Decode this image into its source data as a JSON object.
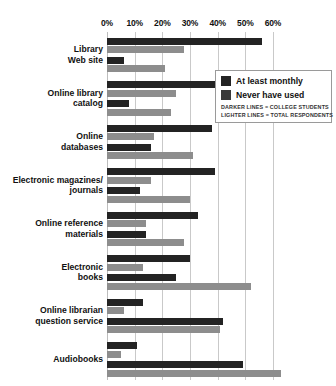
{
  "chart_data": {
    "type": "bar",
    "orientation": "horizontal",
    "title": "",
    "xlabel": "",
    "ylabel": "",
    "xlim": [
      0,
      60
    ],
    "grid": true,
    "tick_labels": [
      "0%",
      "10%",
      "20%",
      "30%",
      "40%",
      "50%",
      "60%"
    ],
    "tick_values": [
      0,
      10,
      20,
      30,
      40,
      50,
      60
    ],
    "legend_position": "upper-right",
    "categories": [
      "Library\nWeb site",
      "Online library\ncatalog",
      "Online\ndatabases",
      "Electronic magazines/\njournals",
      "Online reference\nmaterials",
      "Electronic\nbooks",
      "Online librarian\nquestion service",
      "Audiobooks"
    ],
    "series": [
      {
        "name": "At least monthly — college students",
        "group": "At least monthly",
        "audience": "College students",
        "shade": "darker",
        "values": [
          56,
          48,
          38,
          39,
          33,
          30,
          13,
          11
        ]
      },
      {
        "name": "At least monthly — total respondents",
        "group": "At least monthly",
        "audience": "Total respondents",
        "shade": "lighter",
        "values": [
          28,
          25,
          17,
          16,
          14,
          13,
          6,
          5
        ]
      },
      {
        "name": "Never have used — college students",
        "group": "Never have used",
        "audience": "College students",
        "shade": "darker",
        "values": [
          6,
          8,
          16,
          12,
          14,
          25,
          42,
          49
        ]
      },
      {
        "name": "Never have used — total respondents",
        "group": "Never have used",
        "audience": "Total respondents",
        "shade": "lighter",
        "values": [
          21,
          23,
          31,
          30,
          28,
          52,
          41,
          63
        ]
      }
    ],
    "notes": [
      "DARKER LINES = COLLEGE STUDENTS",
      "LIGHTER LINES = TOTAL RESPONDENTS"
    ]
  },
  "legend": {
    "items": [
      {
        "label": "At least monthly",
        "color": "#232323",
        "swatch_class": "s-monthly"
      },
      {
        "label": "Never have used",
        "color": "#3a3a3a",
        "swatch_class": "s-never"
      }
    ],
    "note_darker": "DARKER LINES = COLLEGE STUDENTS",
    "note_lighter": "LIGHTER LINES = TOTAL RESPONDENTS"
  },
  "colors": {
    "darker_bar": "#232323",
    "lighter_bar": "#8d8d8d",
    "gridline": "#c9c9c9",
    "background": "#ffffff",
    "text": "#111111"
  }
}
